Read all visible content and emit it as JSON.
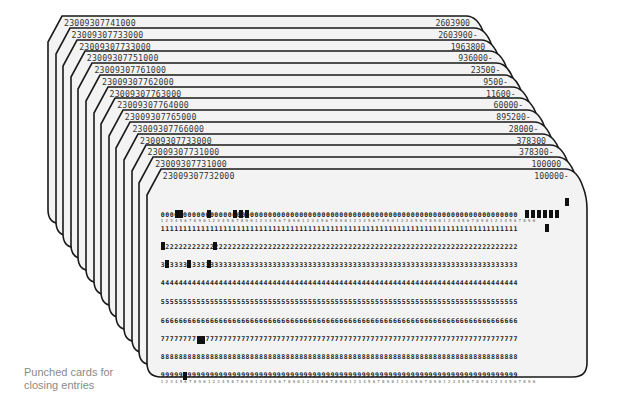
{
  "caption": {
    "line1": "Punched cards for",
    "line2": "closing entries"
  },
  "cards": [
    {
      "number": "23009307741000",
      "amount": "2603900"
    },
    {
      "number": "23009307733000",
      "amount": "2603900-"
    },
    {
      "number": "23009307733000",
      "amount": "1963800"
    },
    {
      "number": "23009307751000",
      "amount": "936000-"
    },
    {
      "number": "23009307761000",
      "amount": "23500-"
    },
    {
      "number": "23009307762000",
      "amount": "9500-"
    },
    {
      "number": "23009307763000",
      "amount": "11600-"
    },
    {
      "number": "23009307764000",
      "amount": "60000-"
    },
    {
      "number": "23009307765000",
      "amount": "895200-"
    },
    {
      "number": "23009307766000",
      "amount": "28000-"
    },
    {
      "number": "23009307733000",
      "amount": "378300"
    },
    {
      "number": "23009307731000",
      "amount": "378300-"
    },
    {
      "number": "23009307731000",
      "amount": "100000"
    },
    {
      "number": "23009307732000",
      "amount": "100000-"
    }
  ],
  "front_card": {
    "number": "23009307732000",
    "amount": "100000-",
    "digit_rows": [
      "0",
      "1",
      "2",
      "3",
      "4",
      "5",
      "6",
      "7",
      "8",
      "9"
    ],
    "colors": {
      "card": "#f2f2f2",
      "outline": "#1a1a1a",
      "punch": "#111111"
    }
  }
}
